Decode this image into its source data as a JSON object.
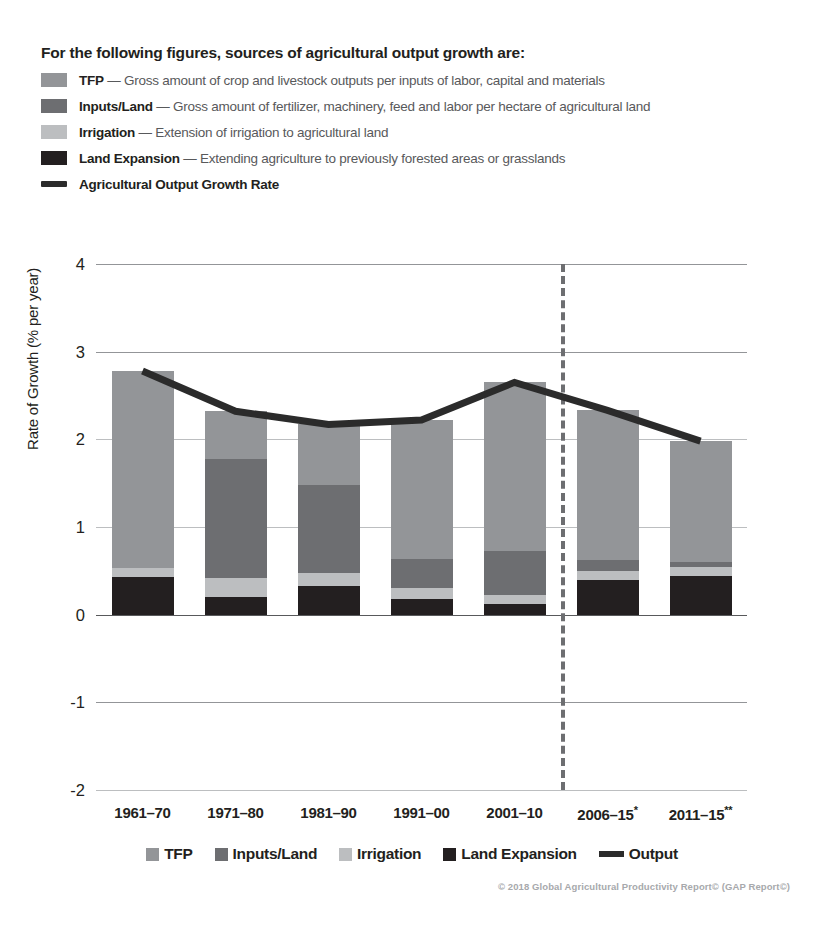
{
  "top_legend": {
    "title": "For the following figures, sources of agricultural output growth are:",
    "items": [
      {
        "key": "tfp",
        "swatch": "#939598",
        "term": "TFP",
        "desc": "— Gross amount of crop and livestock outputs per inputs of labor, capital and materials"
      },
      {
        "key": "inputs",
        "swatch": "#6d6e71",
        "term": "Inputs/Land",
        "desc": "— Gross amount of fertilizer, machinery, feed and labor per hectare of agricultural land"
      },
      {
        "key": "irrigation",
        "swatch": "#bcbec0",
        "term": "Irrigation",
        "desc": "— Extension of irrigation to agricultural land"
      },
      {
        "key": "land",
        "swatch": "#231f20",
        "term": "Land Expansion",
        "desc": "— Extending agriculture to previously forested areas or grasslands"
      },
      {
        "key": "output",
        "swatch": "#2b2b2b",
        "term": "Agricultural Output Growth Rate",
        "desc": ""
      }
    ]
  },
  "bottom_legend": {
    "items": [
      {
        "label": "TFP",
        "color": "#939598",
        "type": "swatch"
      },
      {
        "label": "Inputs/Land",
        "color": "#6d6e71",
        "type": "swatch"
      },
      {
        "label": "Irrigation",
        "color": "#bcbec0",
        "type": "swatch"
      },
      {
        "label": "Land Expansion",
        "color": "#231f20",
        "type": "swatch"
      },
      {
        "label": "Output",
        "color": "#2b2b2b",
        "type": "line"
      }
    ]
  },
  "copyright": "© 2018 Global Agricultural Productivity Report© (GAP Report©)",
  "chart_data": {
    "type": "bar",
    "title": "",
    "xlabel": "",
    "ylabel": "Rate of Growth (% per year)",
    "ylim": [
      -2,
      4
    ],
    "yticks": [
      4,
      3,
      2,
      1,
      0,
      -1,
      -2
    ],
    "grid": true,
    "legend_position": "bottom",
    "stacked": true,
    "categories": [
      "1961–70",
      "1971–80",
      "1981–90",
      "1991–00",
      "2001–10",
      "2006–15*",
      "2011–15**"
    ],
    "category_notes": [
      "",
      "",
      "",
      "",
      "",
      "single asterisk",
      "double asterisk"
    ],
    "series": [
      {
        "name": "Land Expansion",
        "color": "#231f20",
        "values": [
          0.43,
          0.2,
          0.33,
          0.18,
          0.12,
          0.39,
          0.44
        ]
      },
      {
        "name": "Irrigation",
        "color": "#bcbec0",
        "values": [
          0.1,
          0.22,
          0.14,
          0.12,
          0.1,
          0.11,
          0.1
        ]
      },
      {
        "name": "Inputs/Land",
        "color": "#6d6e71",
        "values": [
          0.0,
          1.36,
          1.01,
          0.33,
          0.51,
          0.12,
          0.06
        ]
      },
      {
        "name": "TFP",
        "color": "#939598",
        "values": [
          2.25,
          0.54,
          0.69,
          1.59,
          1.92,
          1.71,
          1.38
        ]
      }
    ],
    "line_series": {
      "name": "Agricultural Output Growth Rate",
      "color": "#2b2b2b",
      "values": [
        2.78,
        2.32,
        2.17,
        2.22,
        2.65,
        2.33,
        1.98
      ]
    },
    "totals": [
      2.78,
      2.32,
      2.17,
      2.22,
      2.65,
      2.33,
      1.98
    ],
    "divider": {
      "after_category_index": 4,
      "style": "dashed",
      "color": "#6d6e71"
    }
  }
}
